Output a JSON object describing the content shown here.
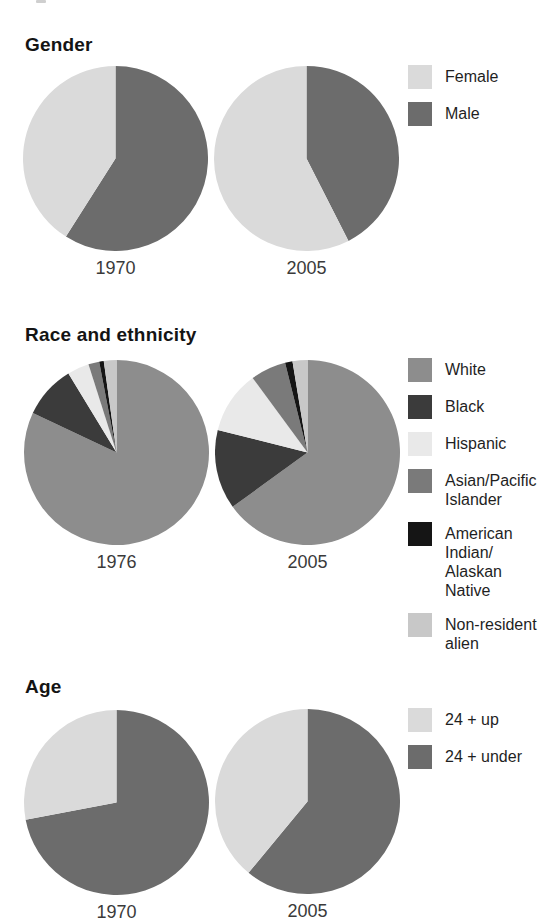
{
  "chart_data": [
    {
      "type": "pie",
      "title": "Gender",
      "unit": "percent",
      "colors": {
        "Male": "#6c6c6c",
        "Female": "#dadada"
      },
      "pies": [
        {
          "label": "1970",
          "slices": [
            {
              "name": "Male",
              "value": 59
            },
            {
              "name": "Female",
              "value": 41
            }
          ]
        },
        {
          "label": "2005",
          "slices": [
            {
              "name": "Male",
              "value": 42.5
            },
            {
              "name": "Female",
              "value": 57.5
            }
          ]
        }
      ],
      "legend": [
        {
          "label": "Female",
          "color": "#dadada"
        },
        {
          "label": "Male",
          "color": "#6c6c6c"
        }
      ]
    },
    {
      "type": "pie",
      "title": "Race and ethnicity",
      "unit": "percent",
      "colors": {
        "White": "#8d8d8d",
        "Black": "#3b3b3b",
        "Hispanic": "#e9e9e9",
        "Asian/Pacific Islander": "#7a7a7a",
        "American Indian/Alaskan Native": "#151515",
        "Non-resident alien": "#c8c8c8"
      },
      "pies": [
        {
          "label": "1976",
          "slices": [
            {
              "name": "White",
              "value": 82
            },
            {
              "name": "Black",
              "value": 9.3
            },
            {
              "name": "Hispanic",
              "value": 3.8
            },
            {
              "name": "Asian/Pacific Islander",
              "value": 1.9
            },
            {
              "name": "American Indian/Alaskan Native",
              "value": 0.8
            },
            {
              "name": "Non-resident alien",
              "value": 2.2
            }
          ]
        },
        {
          "label": "2005",
          "slices": [
            {
              "name": "White",
              "value": 65
            },
            {
              "name": "Black",
              "value": 13.9
            },
            {
              "name": "Hispanic",
              "value": 11
            },
            {
              "name": "Asian/Pacific Islander",
              "value": 6.2
            },
            {
              "name": "American Indian/Alaskan Native",
              "value": 1.3
            },
            {
              "name": "Non-resident alien",
              "value": 2.6
            }
          ]
        }
      ],
      "legend": [
        {
          "label": "White",
          "color": "#8d8d8d"
        },
        {
          "label": "Black",
          "color": "#3b3b3b"
        },
        {
          "label": "Hispanic",
          "color": "#e9e9e9"
        },
        {
          "label": "Asian/Pacific\nIslander",
          "color": "#7a7a7a"
        },
        {
          "label": "American\nIndian/\nAlaskan\nNative",
          "color": "#151515"
        },
        {
          "label": "Non-resident\nalien",
          "color": "#c8c8c8"
        }
      ]
    },
    {
      "type": "pie",
      "title": "Age",
      "unit": "percent",
      "colors": {
        "24 + under": "#6c6c6c",
        "24 + up": "#dadada"
      },
      "pies": [
        {
          "label": "1970",
          "slices": [
            {
              "name": "24 + under",
              "value": 72
            },
            {
              "name": "24 + up",
              "value": 28
            }
          ]
        },
        {
          "label": "2005",
          "slices": [
            {
              "name": "24 + under",
              "value": 61
            },
            {
              "name": "24 + up",
              "value": 39
            }
          ]
        }
      ],
      "legend": [
        {
          "label": "24 + up",
          "color": "#dadada"
        },
        {
          "label": "24 + under",
          "color": "#6c6c6c"
        }
      ]
    }
  ]
}
